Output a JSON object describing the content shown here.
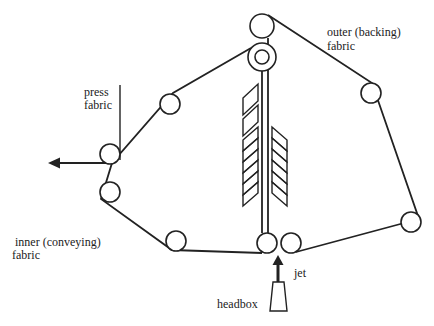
{
  "diagram": {
    "type": "twin-wire former schematic",
    "labels": {
      "outer_fabric_line1": "outer (backing)",
      "outer_fabric_line2": "fabric",
      "press_fabric_line1": "press",
      "press_fabric_line2": "fabric",
      "inner_fabric_line1": "inner (conveying)",
      "inner_fabric_line2": "fabric",
      "jet": "jet",
      "headbox": "headbox"
    },
    "colors": {
      "line": "#222222",
      "background": "#ffffff"
    }
  }
}
